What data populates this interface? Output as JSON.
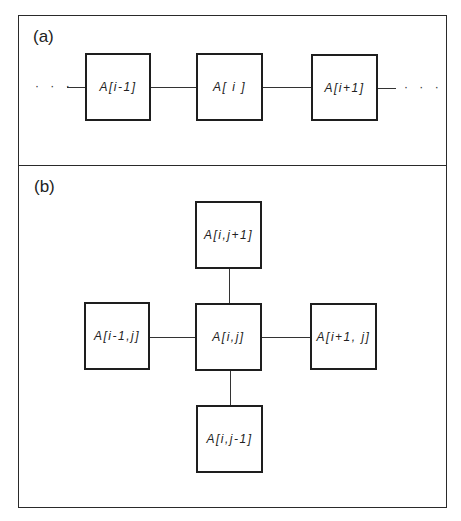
{
  "panel_a": {
    "label": "(a)",
    "left_ellipsis": "· · ·",
    "right_ellipsis": "· · ·",
    "nodes": [
      {
        "id": "a_im1",
        "label": "A[i-1]"
      },
      {
        "id": "a_i",
        "label": "A[ i ]"
      },
      {
        "id": "a_ip1",
        "label": "A[i+1]"
      }
    ]
  },
  "panel_b": {
    "label": "(b)",
    "nodes": {
      "top": {
        "label": "A[i,j+1]"
      },
      "left": {
        "label": "A[i-1,j]"
      },
      "center": {
        "label": "A[i,j]"
      },
      "right": {
        "label": "A[i+1, j]"
      },
      "bottom": {
        "label": "A[i,j-1]"
      }
    }
  },
  "colors": {
    "line": "#1e1e1e",
    "background": "#ffffff"
  }
}
